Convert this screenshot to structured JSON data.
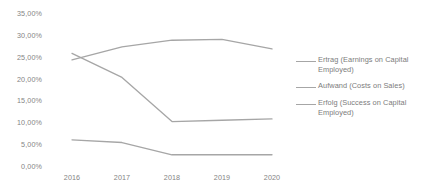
{
  "chart_data": {
    "type": "line",
    "title": "",
    "xlabel": "",
    "ylabel": "",
    "categories": [
      "2016",
      "2017",
      "2018",
      "2019",
      "2020"
    ],
    "x": [
      2016,
      2017,
      2018,
      2019,
      2020
    ],
    "ylim": [
      0,
      35
    ],
    "ytick_values": [
      0,
      5,
      10,
      15,
      20,
      25,
      30,
      35
    ],
    "ytick_labels": [
      "0,00%",
      "5,00%",
      "10,00%",
      "15,00%",
      "20,00%",
      "25,00%",
      "30,00%",
      "35,00%"
    ],
    "grid": false,
    "legend_position": "right",
    "series": [
      {
        "name": "Ertrag (Earnings on Capital Employed)",
        "color": "#a6a6a6",
        "values": [
          26.0,
          20.5,
          10.4,
          10.7,
          11.0
        ]
      },
      {
        "name": "Aufwand (Costs on Sales)",
        "color": "#a6a6a6",
        "values": [
          24.5,
          27.5,
          29.0,
          29.2,
          27.0
        ]
      },
      {
        "name": "Erfolg (Success on Capital Employed)",
        "color": "#a6a6a6",
        "values": [
          6.2,
          5.6,
          2.8,
          2.8,
          2.8
        ]
      }
    ]
  },
  "legend": {
    "items": [
      {
        "label": "Ertrag (Earnings on Capital Employed)",
        "swatch_name": "legend-swatch-ertrag"
      },
      {
        "label": "Aufwand (Costs on Sales)",
        "swatch_name": "legend-swatch-aufwand"
      },
      {
        "label": "Erfolg (Success on Capital Employed)",
        "swatch_name": "legend-swatch-erfolg"
      }
    ]
  },
  "axis": {
    "y_labels": [
      "35,00%",
      "30,00%",
      "25,00%",
      "20,00%",
      "15,00%",
      "10,00%",
      "5,00%",
      "0,00%"
    ],
    "x_labels": [
      "2016",
      "2017",
      "2018",
      "2019",
      "2020"
    ]
  },
  "colors": {
    "line": "#a6a6a6",
    "text": "#848484",
    "background": "#ffffff"
  }
}
